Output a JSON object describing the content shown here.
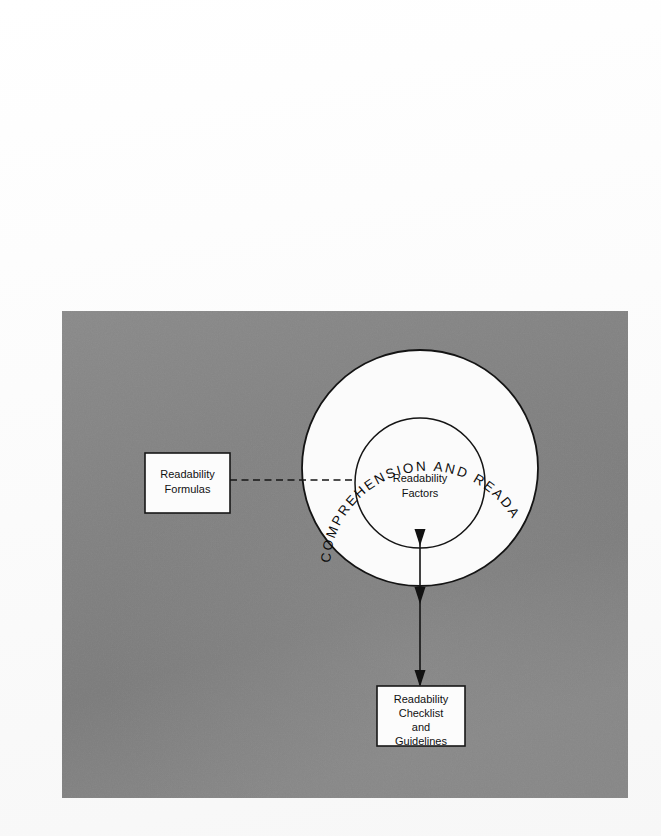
{
  "page": {
    "background_color": "#ffffff",
    "width": 661,
    "height": 836
  },
  "figure": {
    "panel_background_color": "#828282",
    "panel": {
      "x": 62,
      "y": 311,
      "width": 566,
      "height": 487
    },
    "outer_circle": {
      "label": "COMPREHENSION AND READABILITY",
      "fill_color": "#fbfbfb",
      "stroke_color": "#141414",
      "center_x": 358,
      "center_y": 157,
      "radius": 118
    },
    "inner_circle": {
      "label_line_1": "Readability",
      "label_line_2": "Factors",
      "fill_color": "#fbfbfb",
      "stroke_color": "#141414",
      "center_x": 358,
      "center_y": 172,
      "radius": 65
    },
    "left_box": {
      "label_line_1": "Readability",
      "label_line_2": "Formulas",
      "fill_color": "#fcfcfc",
      "stroke_color": "#171717"
    },
    "bottom_box": {
      "label_line_1": "Readability",
      "label_line_2": "Checklist",
      "label_line_3": "and",
      "label_line_4": "Guidelines",
      "fill_color": "#fcfcfc",
      "stroke_color": "#171717"
    },
    "connectors": {
      "dashed_left_to_center": {
        "style": "dashed",
        "color": "#161616"
      },
      "vertical_down": {
        "style": "solid",
        "color": "#141414",
        "arrowhead_count": 3
      }
    }
  }
}
